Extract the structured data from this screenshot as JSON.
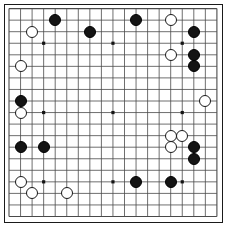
{
  "board": {
    "title": "Go board position",
    "game": "Go (Weiqi/Baduk)",
    "size": 19,
    "line_color": "#4a4a4a",
    "border_color": "#1a1a1a",
    "background_color": "#ffffff",
    "black_color": "#141414",
    "white_color": "#ffffff",
    "origin_x": 9.0,
    "origin_y": 8.6,
    "spacing": 11.55,
    "stone_radius": 6.0,
    "star_points": [
      [
        3,
        3
      ],
      [
        3,
        9
      ],
      [
        3,
        15
      ],
      [
        9,
        3
      ],
      [
        9,
        9
      ],
      [
        9,
        15
      ],
      [
        15,
        3
      ],
      [
        15,
        9
      ],
      [
        15,
        15
      ]
    ],
    "black_stones": [
      [
        4,
        1
      ],
      [
        7,
        2
      ],
      [
        11,
        1
      ],
      [
        16,
        2
      ],
      [
        16,
        4
      ],
      [
        16,
        5
      ],
      [
        1,
        8
      ],
      [
        1,
        12
      ],
      [
        3,
        12
      ],
      [
        16,
        12
      ],
      [
        16,
        13
      ],
      [
        11,
        15
      ],
      [
        14,
        15
      ]
    ],
    "white_stones": [
      [
        2,
        2
      ],
      [
        14,
        1
      ],
      [
        1,
        5
      ],
      [
        14,
        4
      ],
      [
        17,
        8
      ],
      [
        1,
        9
      ],
      [
        14,
        11
      ],
      [
        15,
        11
      ],
      [
        14,
        12
      ],
      [
        1,
        15
      ],
      [
        2,
        16
      ],
      [
        5,
        16
      ]
    ],
    "counts": {
      "black_label": "Black",
      "black_count": "13",
      "white_label": "White",
      "white_count": "12"
    }
  }
}
